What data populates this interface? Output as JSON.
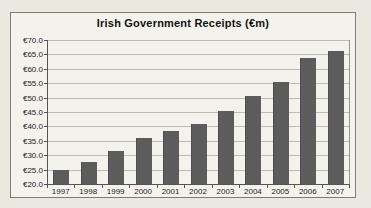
{
  "chart_data": {
    "type": "bar",
    "title": "Irish Government Receipts (€m)",
    "categories": [
      "1997",
      "1998",
      "1999",
      "2000",
      "2001",
      "2002",
      "2003",
      "2004",
      "2005",
      "2006",
      "2007"
    ],
    "values": [
      24.8,
      27.6,
      31.5,
      35.8,
      38.3,
      41.0,
      45.3,
      50.4,
      55.5,
      63.6,
      66.3
    ],
    "xlabel": "",
    "ylabel": "",
    "ylim": [
      20,
      70
    ],
    "ytick_step": 5,
    "ytick_labels_top_to_bottom": [
      "€70.0",
      "€65.0",
      "€60.0",
      "€55.0",
      "€50.0",
      "€45.0",
      "€40.0",
      "€35.0",
      "€30.0",
      "€25.0",
      "€20.0"
    ],
    "currency_prefix": "€",
    "grid": true,
    "legend_position": "none",
    "bar_color": "#5c5c5c"
  },
  "colors": {
    "page_background": "#ebe8df",
    "panel_background": "#f4f2ec",
    "panel_border": "#7d7b74",
    "gridline": "#bdbab1",
    "axis": "#56544e",
    "bar": "#5c5c5c",
    "text": "#23221f"
  }
}
